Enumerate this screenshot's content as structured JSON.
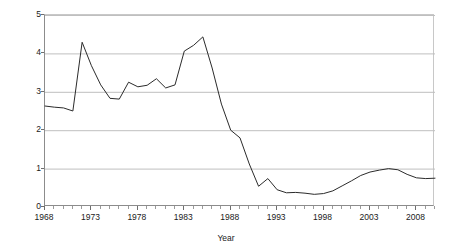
{
  "chart_data": {
    "type": "line",
    "title": "",
    "xlabel": "Year",
    "ylabel": "Per capita (chained 2009) S$",
    "xlim": [
      1968,
      2010
    ],
    "ylim": [
      0,
      5
    ],
    "grid": true,
    "legend": false,
    "x_tick_labels": [
      "1968",
      "1973",
      "1978",
      "1983",
      "1988",
      "1993",
      "1998",
      "2003",
      "2008"
    ],
    "y_tick_labels": [
      "0",
      "1",
      "2",
      "3",
      "4",
      "5"
    ],
    "x": [
      1968,
      1969,
      1970,
      1971,
      1972,
      1973,
      1974,
      1975,
      1976,
      1977,
      1978,
      1979,
      1980,
      1981,
      1982,
      1983,
      1984,
      1985,
      1986,
      1987,
      1988,
      1989,
      1990,
      1991,
      1992,
      1993,
      1994,
      1995,
      1996,
      1997,
      1998,
      1999,
      2000,
      2001,
      2002,
      2003,
      2004,
      2005,
      2006,
      2007,
      2008,
      2009,
      2010
    ],
    "series": [
      {
        "name": "Per capita (chained 2009) S$",
        "color": "#2b2b2b",
        "values": [
          2.63,
          2.6,
          2.58,
          2.5,
          4.29,
          3.68,
          3.18,
          2.83,
          2.81,
          3.25,
          3.13,
          3.17,
          3.34,
          3.1,
          3.18,
          4.06,
          4.21,
          4.43,
          3.62,
          2.68,
          2.0,
          1.8,
          1.12,
          0.54,
          0.74,
          0.45,
          0.37,
          0.38,
          0.36,
          0.33,
          0.35,
          0.42,
          0.55,
          0.68,
          0.82,
          0.91,
          0.96,
          1.0,
          0.97,
          0.85,
          0.76,
          0.74,
          0.75
        ]
      }
    ]
  }
}
